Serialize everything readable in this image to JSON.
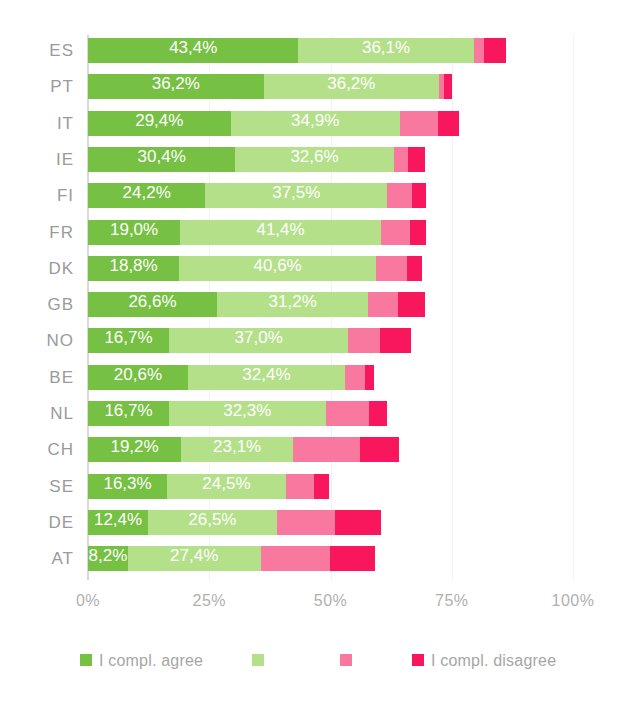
{
  "chart_data": {
    "type": "bar",
    "orientation": "horizontal",
    "stacked": true,
    "title": "",
    "xlabel": "",
    "ylabel": "",
    "xlim": [
      0,
      100
    ],
    "xticks": [
      "0%",
      "25%",
      "50%",
      "75%",
      "100%"
    ],
    "xtick_values": [
      0,
      25,
      50,
      75,
      100
    ],
    "grid": true,
    "legend_position": "bottom",
    "categories": [
      "ES",
      "PT",
      "IT",
      "IE",
      "FI",
      "FR",
      "DK",
      "GB",
      "NO",
      "BE",
      "NL",
      "CH",
      "SE",
      "DE",
      "AT"
    ],
    "series": [
      {
        "name": "I compl. agree",
        "color": "#76c043",
        "values": [
          43.4,
          36.2,
          29.4,
          30.4,
          24.2,
          19.0,
          18.8,
          26.6,
          16.7,
          20.6,
          16.7,
          19.2,
          16.3,
          12.4,
          8.2
        ]
      },
      {
        "name": "agree",
        "color": "#b4e08a",
        "values": [
          36.1,
          36.2,
          34.9,
          32.6,
          37.5,
          41.4,
          40.6,
          31.2,
          37.0,
          32.4,
          32.3,
          23.1,
          24.5,
          26.5,
          27.4
        ]
      },
      {
        "name": "disagree",
        "color": "#f9789f",
        "values": [
          2.1,
          1.0,
          7.8,
          3.0,
          5.1,
          6.0,
          6.4,
          6.1,
          6.6,
          4.1,
          8.9,
          13.7,
          5.7,
          12.0,
          14.2
        ]
      },
      {
        "name": "I compl. disagree",
        "color": "#f8165d",
        "values": [
          4.5,
          1.6,
          4.5,
          3.4,
          2.9,
          3.3,
          3.0,
          5.6,
          6.2,
          1.8,
          3.8,
          8.2,
          3.1,
          9.5,
          9.4
        ]
      }
    ],
    "value_labels": {
      "ES": {
        "agree_strong": "43,4%",
        "agree": "36,1%"
      },
      "PT": {
        "agree_strong": "36,2%",
        "agree": "36,2%"
      },
      "IT": {
        "agree_strong": "29,4%",
        "agree": "34,9%"
      },
      "IE": {
        "agree_strong": "30,4%",
        "agree": "32,6%"
      },
      "FI": {
        "agree_strong": "24,2%",
        "agree": "37,5%"
      },
      "FR": {
        "agree_strong": "19,0%",
        "agree": "41,4%"
      },
      "DK": {
        "agree_strong": "18,8%",
        "agree": "40,6%"
      },
      "GB": {
        "agree_strong": "26,6%",
        "agree": "31,2%"
      },
      "NO": {
        "agree_strong": "16,7%",
        "agree": "37,0%"
      },
      "BE": {
        "agree_strong": "20,6%",
        "agree": "32,4%"
      },
      "NL": {
        "agree_strong": "16,7%",
        "agree": "32,3%"
      },
      "CH": {
        "agree_strong": "19,2%",
        "agree": "23,1%"
      },
      "SE": {
        "agree_strong": "16,3%",
        "agree": "24,5%"
      },
      "DE": {
        "agree_strong": "12,4%",
        "agree": "26,5%"
      },
      "AT": {
        "agree_strong": "8,2%",
        "agree": "27,4%"
      }
    }
  },
  "colors": {
    "agree_strong": "#76c043",
    "agree": "#b4e08a",
    "disagree": "#f9789f",
    "disagree_strong": "#f8165d",
    "axis": "#d9d9d9",
    "grid": "#f2f2f2",
    "tick_text": "#b0b0b0",
    "category_text": "#9a9a9a",
    "legend_text": "#a6a6a6",
    "value_text": "#ffffff",
    "background": "#ffffff"
  },
  "legend": {
    "items": [
      {
        "label": "I compl. agree",
        "color": "#76c043",
        "has_label": true
      },
      {
        "label": "",
        "color": "#b4e08a",
        "has_label": false
      },
      {
        "label": "",
        "color": "#f9789f",
        "has_label": false
      },
      {
        "label": "I compl. disagree",
        "color": "#f8165d",
        "has_label": true
      }
    ]
  },
  "axis": {
    "ticks": [
      {
        "label": "0%",
        "value": 0
      },
      {
        "label": "25%",
        "value": 25
      },
      {
        "label": "50%",
        "value": 50
      },
      {
        "label": "75%",
        "value": 75
      },
      {
        "label": "100%",
        "value": 100
      }
    ]
  }
}
